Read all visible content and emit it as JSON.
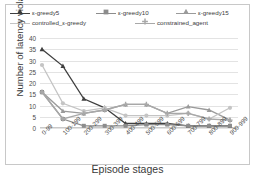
{
  "chart_data": {
    "type": "line",
    "title": "",
    "xlabel": "Episode stages",
    "ylabel": "Number of latency violations",
    "categories": [
      "0-99",
      "100-199",
      "200-299",
      "300-399",
      "400-499",
      "500-599",
      "600-699",
      "700-799",
      "800-899",
      "900-999"
    ],
    "ylim": [
      0,
      40
    ],
    "yticks": [
      0,
      5,
      10,
      15,
      20,
      25,
      30,
      35,
      40
    ],
    "grid": true,
    "legend_position": "top",
    "series": [
      {
        "name": "ε-greedy5",
        "color": "#3f3f3f",
        "marker": "triangle",
        "values": [
          35,
          27.5,
          13,
          9,
          2,
          2,
          2,
          1,
          1,
          1
        ]
      },
      {
        "name": "ε-greedy10",
        "color": "#8c8c8c",
        "marker": "square",
        "values": [
          16,
          4,
          1,
          1,
          1,
          1.5,
          1.5,
          1,
          1,
          1
        ]
      },
      {
        "name": "ε-greedy15",
        "color": "#9a9a9a",
        "marker": "triangle",
        "values": [
          16,
          7.5,
          6.5,
          8,
          10.5,
          10.5,
          6.5,
          9.5,
          8,
          3.5
        ]
      },
      {
        "name": "controlled_ε-greedy",
        "color": "#c4c4c4",
        "marker": "circle",
        "values": [
          28,
          11,
          7.5,
          9,
          5.5,
          5.5,
          5.5,
          6.5,
          4,
          9
        ]
      },
      {
        "name": "constrained_agent",
        "color": "#a8a8a8",
        "marker": "plus",
        "values": [
          16,
          4,
          6.5,
          8,
          10.5,
          10.5,
          6.5,
          6.5,
          4,
          3.5
        ]
      }
    ]
  },
  "legend": {
    "rows": [
      [
        {
          "label": "ε-greedy5"
        },
        {
          "label": "ε-greedy10"
        },
        {
          "label": "ε-greedy15"
        }
      ],
      [
        {
          "label": "controlled_ε-greedy"
        },
        {
          "label": "constrained_agent"
        }
      ]
    ]
  }
}
